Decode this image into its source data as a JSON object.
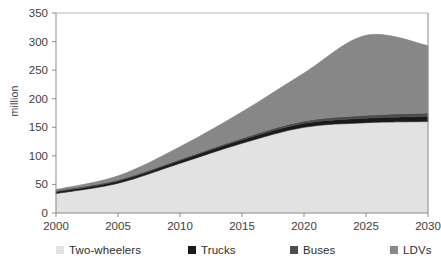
{
  "chart_data": {
    "type": "area",
    "stacked": true,
    "title": "",
    "subtitle": "",
    "xlabel": "",
    "ylabel": "million",
    "xlim": [
      2000,
      2030
    ],
    "ylim": [
      0,
      350
    ],
    "ytick_step": 50,
    "xtick_step": 5,
    "grid": false,
    "legend_position": "bottom",
    "x": [
      2000,
      2005,
      2010,
      2015,
      2020,
      2025,
      2030
    ],
    "xticks": [
      "2000",
      "2005",
      "2010",
      "2015",
      "2020",
      "2025",
      "2030"
    ],
    "yticks": [
      "0",
      "50",
      "100",
      "150",
      "200",
      "250",
      "300",
      "350"
    ],
    "series": [
      {
        "name": "Two-wheelers",
        "color": "#e2e2e2",
        "values": [
          34,
          52,
          87,
          122,
          150,
          158,
          160
        ]
      },
      {
        "name": "Trucks",
        "color": "#1a1a1a",
        "values": [
          3,
          4,
          5,
          6,
          7,
          8,
          9
        ]
      },
      {
        "name": "Buses",
        "color": "#4d4d4d",
        "values": [
          2,
          2,
          2,
          3,
          4,
          5,
          6
        ]
      },
      {
        "name": "LDVs",
        "color": "#878787",
        "values": [
          2,
          7,
          22,
          46,
          84,
          140,
          118
        ]
      }
    ],
    "totals": [
      41,
      65,
      116,
      177,
      245,
      311,
      293
    ]
  },
  "legend": {
    "items": [
      {
        "label": "Two-wheelers",
        "color": "#e2e2e2",
        "x": 56
      },
      {
        "label": "Trucks",
        "color": "#1a1a1a",
        "x": 188
      },
      {
        "label": "Buses",
        "color": "#4d4d4d",
        "x": 290
      },
      {
        "label": "LDVs",
        "color": "#878787",
        "x": 390
      }
    ]
  },
  "axes": {
    "y_title": "million"
  }
}
